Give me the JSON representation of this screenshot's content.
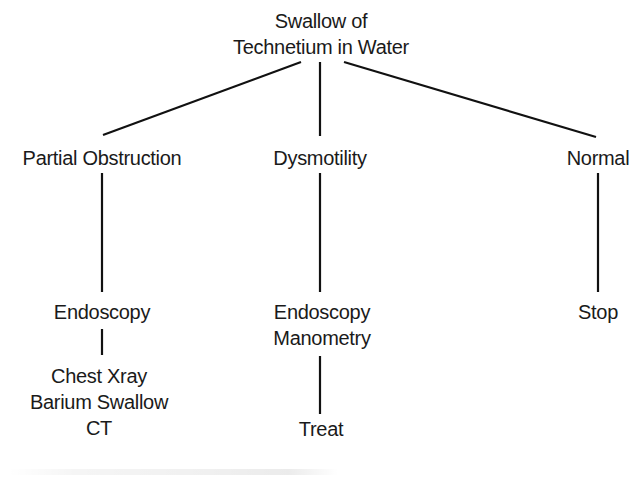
{
  "diagram": {
    "type": "flowchart-tree",
    "root": {
      "id": "root",
      "lines": [
        "Swallow of",
        "Technetium in Water"
      ],
      "children": [
        "partial",
        "dysmotility",
        "normal"
      ]
    },
    "nodes": {
      "root": {
        "lines": [
          "Swallow of",
          "Technetium in Water"
        ]
      },
      "partial": {
        "lines": [
          "Partial Obstruction"
        ]
      },
      "dysmotility": {
        "lines": [
          "Dysmotility"
        ]
      },
      "normal": {
        "lines": [
          "Normal"
        ]
      },
      "endoscopy_left": {
        "lines": [
          "Endoscopy"
        ]
      },
      "imaging": {
        "lines": [
          "Chest Xray",
          "Barium Swallow",
          "CT"
        ]
      },
      "endo_mano": {
        "lines": [
          "Endoscopy",
          "Manometry"
        ]
      },
      "treat": {
        "lines": [
          "Treat"
        ]
      },
      "stop": {
        "lines": [
          "Stop"
        ]
      }
    },
    "edges": [
      {
        "from": "root",
        "to": "partial"
      },
      {
        "from": "root",
        "to": "dysmotility"
      },
      {
        "from": "root",
        "to": "normal"
      },
      {
        "from": "partial",
        "to": "endoscopy_left"
      },
      {
        "from": "endoscopy_left",
        "to": "imaging"
      },
      {
        "from": "dysmotility",
        "to": "endo_mano"
      },
      {
        "from": "endo_mano",
        "to": "treat"
      },
      {
        "from": "normal",
        "to": "stop"
      }
    ],
    "line_color": "#111111"
  }
}
